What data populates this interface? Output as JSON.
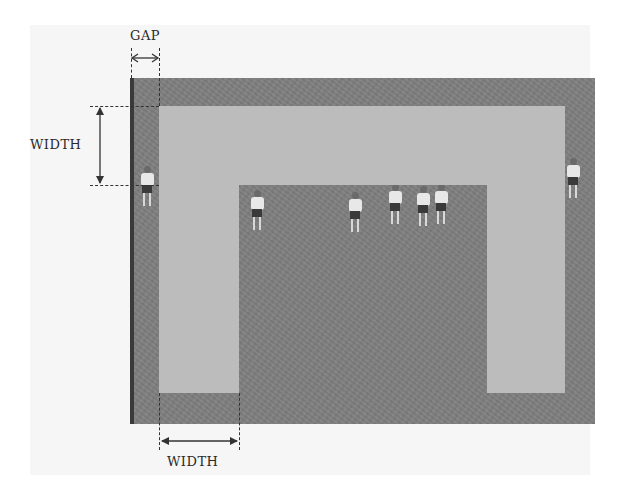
{
  "diagram": {
    "title": "",
    "labels": {
      "gap": "GAP",
      "width_vertical": "WIDTH",
      "width_horizontal": "WIDTH"
    },
    "colors": {
      "photo_background": "#808080",
      "mask_frame": "#bcbcbc",
      "left_edge": "#3a3a3a",
      "paper": "#f6f6f6"
    },
    "elements": [
      {
        "name": "photo",
        "type": "image",
        "content": "soccer players on grass field"
      },
      {
        "name": "mask-frame",
        "type": "inverted-U band",
        "parts": [
          "top-bar",
          "left-leg",
          "right-leg"
        ]
      },
      {
        "name": "gap-dimension",
        "type": "horizontal double arrow",
        "label": "GAP"
      },
      {
        "name": "width-dimension-vertical",
        "type": "vertical double arrow",
        "label": "WIDTH"
      },
      {
        "name": "width-dimension-horizontal",
        "type": "horizontal double arrow",
        "label": "WIDTH"
      }
    ]
  }
}
